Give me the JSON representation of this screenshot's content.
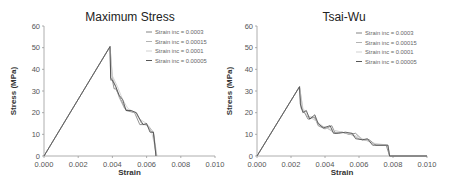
{
  "chart_data": [
    {
      "type": "line",
      "title": "Maximum Stress",
      "xlabel": "Strain",
      "ylabel": "Stress (MPa)",
      "xlim": [
        0,
        0.01
      ],
      "ylim": [
        0,
        60
      ],
      "xticks": [
        "0.000",
        "0.002",
        "0.004",
        "0.006",
        "0.008",
        "0.010"
      ],
      "yticks": [
        "0",
        "10",
        "20",
        "30",
        "40",
        "50",
        "60"
      ],
      "grid": false,
      "legend_position": "upper right",
      "series": [
        {
          "name": "Strain inc = 0.0003",
          "color": "#777777",
          "x": [
            0,
            0.00386,
            0.0039,
            0.004,
            0.0041,
            0.0042,
            0.0045,
            0.0048,
            0.0053,
            0.0056,
            0.006,
            0.0063,
            0.0064,
            0.00655
          ],
          "y": [
            0,
            50.5,
            35,
            35,
            31,
            31,
            26,
            21,
            20,
            14.5,
            14.5,
            11,
            11,
            0
          ]
        },
        {
          "name": "Strain inc = 0.00015",
          "color": "#aaaaaa",
          "x": [
            0,
            0.00386,
            0.004,
            0.0042,
            0.0044,
            0.0047,
            0.005,
            0.0054,
            0.0057,
            0.0061,
            0.0064,
            0.0066
          ],
          "y": [
            0,
            50.5,
            36,
            32,
            27,
            22,
            21,
            20,
            15,
            14,
            11,
            0
          ]
        },
        {
          "name": "Strain inc = 0.0001",
          "color": "#cccccc",
          "x": [
            0,
            0.00386,
            0.004,
            0.0043,
            0.0046,
            0.0049,
            0.0053,
            0.0056,
            0.006,
            0.0063,
            0.0066
          ],
          "y": [
            0,
            50.5,
            37,
            32,
            26,
            22,
            20,
            17,
            15,
            11,
            0
          ]
        },
        {
          "name": "Strain inc = 0.00005",
          "color": "#444444",
          "x": [
            0,
            0.00386,
            0.0039,
            0.004,
            0.0042,
            0.0044,
            0.0046,
            0.0048,
            0.0051,
            0.0054,
            0.0056,
            0.0058,
            0.006,
            0.0062,
            0.0064,
            0.00655
          ],
          "y": [
            0,
            50.5,
            36,
            35,
            32,
            28,
            26,
            21,
            21,
            20,
            17,
            14.5,
            15,
            11,
            11,
            0
          ]
        }
      ]
    },
    {
      "type": "line",
      "title": "Tsai-Wu",
      "xlabel": "Strain",
      "ylabel": "Stress (MPa)",
      "xlim": [
        0,
        0.01
      ],
      "ylim": [
        0,
        60
      ],
      "xticks": [
        "0.000",
        "0.002",
        "0.004",
        "0.006",
        "0.008",
        "0.010"
      ],
      "yticks": [
        "0",
        "10",
        "20",
        "30",
        "40",
        "50",
        "60"
      ],
      "grid": false,
      "legend_position": "upper right",
      "series": [
        {
          "name": "Strain inc = 0.0003",
          "color": "#777777",
          "x": [
            0,
            0.0025,
            0.0026,
            0.0028,
            0.003,
            0.0034,
            0.0036,
            0.004,
            0.0044,
            0.0046,
            0.005,
            0.0054,
            0.0058,
            0.0062,
            0.0066,
            0.007,
            0.0076,
            0.0078,
            0.01
          ],
          "y": [
            0,
            32,
            22,
            20,
            17,
            18,
            14,
            12.5,
            14,
            10.5,
            11,
            10,
            10.5,
            7.5,
            7.5,
            5,
            5,
            0,
            0
          ]
        },
        {
          "name": "Strain inc = 0.00015",
          "color": "#aaaaaa",
          "x": [
            0,
            0.0025,
            0.0027,
            0.003,
            0.0033,
            0.0037,
            0.0041,
            0.0045,
            0.005,
            0.0055,
            0.006,
            0.0065,
            0.007,
            0.0077,
            0.0078,
            0.01
          ],
          "y": [
            0,
            32,
            21,
            18,
            18,
            14,
            13,
            11,
            11,
            10,
            8,
            7,
            5,
            5,
            0,
            0
          ]
        },
        {
          "name": "Strain inc = 0.0001",
          "color": "#cccccc",
          "x": [
            0,
            0.0025,
            0.0027,
            0.0031,
            0.0035,
            0.004,
            0.0045,
            0.005,
            0.0056,
            0.0062,
            0.0068,
            0.0077,
            0.0078,
            0.01
          ],
          "y": [
            0,
            32,
            22,
            18,
            16,
            13,
            12,
            11,
            10,
            8,
            6,
            5,
            0,
            0
          ]
        },
        {
          "name": "Strain inc = 0.00005",
          "color": "#444444",
          "x": [
            0,
            0.0025,
            0.00255,
            0.0027,
            0.0029,
            0.0031,
            0.0034,
            0.0036,
            0.0039,
            0.0043,
            0.0045,
            0.0048,
            0.0052,
            0.0056,
            0.0058,
            0.0062,
            0.0065,
            0.0068,
            0.0077,
            0.0078,
            0.01
          ],
          "y": [
            0,
            32,
            24,
            20,
            21,
            17,
            19,
            15,
            13,
            14,
            10.5,
            10.5,
            11,
            10.5,
            8,
            7.5,
            8,
            5,
            5,
            0,
            0
          ]
        }
      ]
    }
  ]
}
